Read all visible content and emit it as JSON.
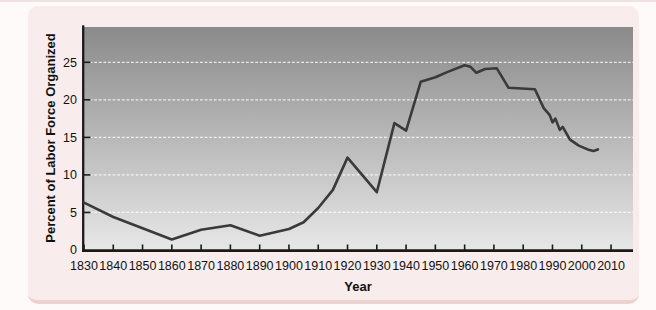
{
  "figure": {
    "colors": {
      "page_bg": "#fdfaf9",
      "card_bg": "#f8edec",
      "card_edge": "#ecd3d2",
      "plot_gradient_top": "#8a8a8a",
      "plot_gradient_bottom": "#e7e7e7",
      "grid": "#ffffff",
      "axis": "#1a1a1a",
      "line": "#3a3a3a",
      "text": "#111111"
    }
  },
  "chart_data": {
    "type": "line",
    "title": "",
    "xlabel": "Year",
    "ylabel": "Percent of Labor Force Organized",
    "x_tick_labels": [
      "1830",
      "1840",
      "1850",
      "1860",
      "1870",
      "1880",
      "1890",
      "1900",
      "1910",
      "1920",
      "1930",
      "1940",
      "1950",
      "1960",
      "1970",
      "1980",
      "1990",
      "2000",
      "2010"
    ],
    "y_tick_labels": [
      "0",
      "5",
      "10",
      "15",
      "20",
      "25"
    ],
    "xlim": [
      1830,
      2017.5
    ],
    "ylim": [
      0,
      29.7
    ],
    "grid": "horizontal white dashed lines at each labeled y tick",
    "legend": "none",
    "series": [
      {
        "name": "Percent of labor force organized",
        "points": [
          [
            1830,
            6.3
          ],
          [
            1840,
            4.4
          ],
          [
            1850,
            2.9
          ],
          [
            1860,
            1.4
          ],
          [
            1870,
            2.7
          ],
          [
            1880,
            3.3
          ],
          [
            1890,
            1.9
          ],
          [
            1900,
            2.8
          ],
          [
            1905,
            3.7
          ],
          [
            1910,
            5.6
          ],
          [
            1915,
            8.0
          ],
          [
            1920,
            12.3
          ],
          [
            1930,
            7.7
          ],
          [
            1936,
            16.9
          ],
          [
            1940,
            15.9
          ],
          [
            1945,
            22.4
          ],
          [
            1950,
            23.0
          ],
          [
            1954,
            23.7
          ],
          [
            1960,
            24.6
          ],
          [
            1962,
            24.4
          ],
          [
            1964,
            23.6
          ],
          [
            1967,
            24.1
          ],
          [
            1971,
            24.2
          ],
          [
            1975,
            21.6
          ],
          [
            1984,
            21.4
          ],
          [
            1987,
            18.9
          ],
          [
            1989,
            18.0
          ],
          [
            1990,
            17.0
          ],
          [
            1991,
            17.5
          ],
          [
            1992.5,
            16.0
          ],
          [
            1993.5,
            16.4
          ],
          [
            1996,
            14.7
          ],
          [
            1999,
            13.9
          ],
          [
            2002,
            13.4
          ],
          [
            2004,
            13.2
          ],
          [
            2005.5,
            13.4
          ]
        ]
      }
    ]
  }
}
